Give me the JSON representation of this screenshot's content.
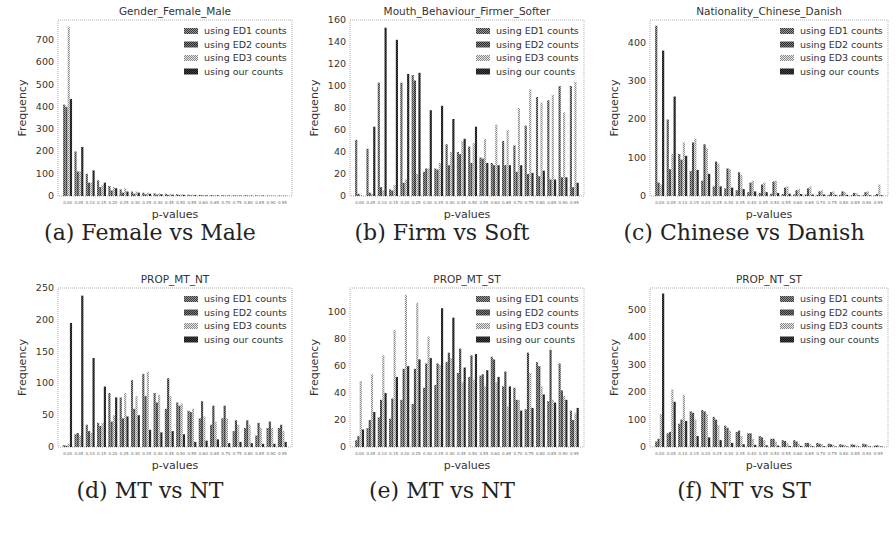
{
  "figure": {
    "captions": [
      "(a) Female vs Male",
      "(b) Firm vs Soft",
      "(c) Chinese vs Danish",
      "(d) MT vs NT",
      "(e) MT vs NT",
      "(f) NT vs ST"
    ]
  },
  "legend": {
    "entries": [
      "using ED1 counts",
      "using ED2 counts",
      "using ED3 counts",
      "using our counts"
    ],
    "colors": [
      "#555555",
      "#6a6a6a",
      "#b5b5b5",
      "#2a2a2a"
    ]
  },
  "chart_data": [
    {
      "type": "bar",
      "title": "Gender_Female_Male",
      "xlabel": "p-values",
      "ylabel": "Frequency",
      "ylim": [
        0,
        790
      ],
      "yticks": [
        0,
        100,
        200,
        300,
        400,
        500,
        600,
        700
      ],
      "categories": [
        "0.00",
        "0.05",
        "0.10",
        "0.15",
        "0.20",
        "0.25",
        "0.30",
        "0.35",
        "0.40",
        "0.45",
        "0.50",
        "0.55",
        "0.60",
        "0.65",
        "0.70",
        "0.75",
        "0.80",
        "0.85",
        "0.90",
        "0.95"
      ],
      "series": [
        {
          "name": "using ED1 counts",
          "values": [
            410,
            200,
            100,
            70,
            45,
            30,
            20,
            15,
            12,
            10,
            8,
            6,
            5,
            4,
            4,
            3,
            3,
            3,
            2,
            2
          ]
        },
        {
          "name": "using ED2 counts",
          "values": [
            400,
            110,
            60,
            40,
            25,
            15,
            10,
            8,
            6,
            5,
            4,
            3,
            3,
            2,
            2,
            2,
            2,
            1,
            1,
            1
          ]
        },
        {
          "name": "using ED3 counts",
          "values": [
            760,
            110,
            60,
            50,
            40,
            35,
            20,
            15,
            12,
            10,
            8,
            6,
            5,
            4,
            4,
            3,
            3,
            3,
            3,
            3
          ]
        },
        {
          "name": "using our counts",
          "values": [
            435,
            220,
            115,
            60,
            35,
            20,
            15,
            10,
            8,
            6,
            5,
            4,
            3,
            3,
            2,
            2,
            2,
            2,
            1,
            1
          ]
        }
      ],
      "legend_position": "upper right",
      "grid": false
    },
    {
      "type": "bar",
      "title": "Mouth_Behaviour_Firmer_Softer",
      "xlabel": "p-values",
      "ylabel": "Frequency",
      "ylim": [
        0,
        160
      ],
      "yticks": [
        0,
        20,
        40,
        60,
        80,
        100,
        120,
        140,
        160
      ],
      "categories": [
        "0.00",
        "0.05",
        "0.10",
        "0.15",
        "0.20",
        "0.25",
        "0.30",
        "0.35",
        "0.40",
        "0.45",
        "0.50",
        "0.55",
        "0.60",
        "0.65",
        "0.70",
        "0.75",
        "0.80",
        "0.85",
        "0.90",
        "0.95"
      ],
      "series": [
        {
          "name": "using ED1 counts",
          "values": [
            51,
            43,
            103,
            6,
            103,
            110,
            22,
            25,
            47,
            40,
            45,
            35,
            30,
            50,
            46,
            64,
            90,
            87,
            100,
            100
          ]
        },
        {
          "name": "using ED2 counts",
          "values": [
            2,
            3,
            8,
            5,
            12,
            105,
            25,
            24,
            28,
            38,
            30,
            34,
            28,
            28,
            22,
            20,
            18,
            15,
            17,
            8
          ]
        },
        {
          "name": "using ED3 counts",
          "values": [
            1,
            2,
            5,
            10,
            15,
            20,
            25,
            30,
            40,
            50,
            48,
            52,
            65,
            60,
            80,
            97,
            85,
            92,
            76,
            118
          ]
        },
        {
          "name": "using our counts",
          "values": [
            0,
            63,
            153,
            142,
            111,
            112,
            78,
            82,
            70,
            52,
            63,
            30,
            28,
            28,
            28,
            21,
            23,
            15,
            17,
            12
          ]
        }
      ],
      "legend_position": "upper right",
      "grid": false
    },
    {
      "type": "bar",
      "title": "Nationality_Chinese_Danish",
      "xlabel": "p-values",
      "ylabel": "Frequency",
      "ylim": [
        0,
        460
      ],
      "yticks": [
        0,
        100,
        200,
        300,
        400
      ],
      "categories": [
        "0.00",
        "0.05",
        "0.10",
        "0.15",
        "0.20",
        "0.25",
        "0.30",
        "0.35",
        "0.40",
        "0.45",
        "0.50",
        "0.55",
        "0.60",
        "0.65",
        "0.70",
        "0.75",
        "0.80",
        "0.85",
        "0.90",
        "0.95"
      ],
      "series": [
        {
          "name": "using ED1 counts",
          "values": [
            445,
            200,
            110,
            65,
            40,
            25,
            20,
            15,
            10,
            8,
            6,
            5,
            4,
            4,
            3,
            3,
            3,
            2,
            2,
            2
          ]
        },
        {
          "name": "using ED2 counts",
          "values": [
            35,
            70,
            95,
            140,
            135,
            90,
            72,
            62,
            35,
            30,
            38,
            22,
            15,
            20,
            12,
            10,
            12,
            8,
            10,
            5
          ]
        },
        {
          "name": "using ED3 counts",
          "values": [
            30,
            110,
            140,
            150,
            125,
            85,
            70,
            55,
            40,
            35,
            40,
            25,
            18,
            25,
            15,
            12,
            10,
            8,
            12,
            30
          ]
        },
        {
          "name": "using our counts",
          "values": [
            380,
            260,
            105,
            68,
            58,
            25,
            22,
            18,
            12,
            10,
            8,
            6,
            5,
            4,
            4,
            3,
            3,
            2,
            2,
            2
          ]
        }
      ],
      "legend_position": "upper right",
      "grid": false
    },
    {
      "type": "bar",
      "title": "PROP_MT_NT",
      "xlabel": "p-values",
      "ylabel": "Frequency",
      "ylim": [
        0,
        250
      ],
      "yticks": [
        0,
        50,
        100,
        150,
        200,
        250
      ],
      "categories": [
        "0.00",
        "0.05",
        "0.10",
        "0.15",
        "0.20",
        "0.25",
        "0.30",
        "0.35",
        "0.40",
        "0.45",
        "0.50",
        "0.55",
        "0.60",
        "0.65",
        "0.70",
        "0.75",
        "0.80",
        "0.85",
        "0.90",
        "0.95"
      ],
      "series": [
        {
          "name": "using ED1 counts",
          "values": [
            3,
            20,
            35,
            38,
            85,
            78,
            105,
            115,
            85,
            60,
            70,
            57,
            45,
            35,
            45,
            25,
            30,
            18,
            30,
            30
          ]
        },
        {
          "name": "using ED2 counts",
          "values": [
            2,
            22,
            25,
            33,
            40,
            45,
            60,
            80,
            70,
            108,
            65,
            55,
            72,
            65,
            65,
            42,
            42,
            38,
            40,
            35
          ]
        },
        {
          "name": "using ED3 counts",
          "values": [
            5,
            18,
            22,
            38,
            50,
            85,
            80,
            118,
            82,
            80,
            68,
            60,
            48,
            40,
            45,
            35,
            35,
            30,
            30,
            25
          ]
        },
        {
          "name": "using our counts",
          "values": [
            195,
            238,
            140,
            95,
            78,
            48,
            50,
            27,
            23,
            25,
            20,
            8,
            10,
            12,
            6,
            8,
            6,
            5,
            5,
            8
          ]
        }
      ],
      "legend_position": "upper right",
      "grid": false
    },
    {
      "type": "bar",
      "title": "PROP_MT_ST",
      "xlabel": "p-values",
      "ylabel": "Frequency",
      "ylim": [
        0,
        118
      ],
      "yticks": [
        0,
        20,
        40,
        60,
        80,
        100
      ],
      "categories": [
        "0.00",
        "0.05",
        "0.10",
        "0.15",
        "0.20",
        "0.25",
        "0.30",
        "0.35",
        "0.40",
        "0.45",
        "0.50",
        "0.55",
        "0.60",
        "0.65",
        "0.70",
        "0.75",
        "0.80",
        "0.85",
        "0.90",
        "0.95"
      ],
      "series": [
        {
          "name": "using ED1 counts",
          "values": [
            5,
            14,
            22,
            21,
            35,
            32,
            44,
            46,
            63,
            55,
            52,
            53,
            67,
            45,
            44,
            28,
            63,
            34,
            62,
            27
          ]
        },
        {
          "name": "using ED2 counts",
          "values": [
            8,
            20,
            35,
            36,
            58,
            58,
            62,
            62,
            70,
            73,
            68,
            54,
            65,
            56,
            35,
            70,
            60,
            75,
            42,
            20
          ]
        },
        {
          "name": "using ED3 counts",
          "values": [
            49,
            54,
            68,
            87,
            113,
            107,
            82,
            61,
            66,
            48,
            50,
            45,
            48,
            30,
            35,
            55,
            45,
            35,
            38,
            25
          ]
        },
        {
          "name": "using our counts",
          "values": [
            13,
            26,
            40,
            52,
            60,
            65,
            66,
            103,
            96,
            59,
            69,
            57,
            52,
            45,
            27,
            29,
            39,
            33,
            35,
            29
          ]
        }
      ],
      "legend_position": "upper right",
      "grid": false
    },
    {
      "type": "bar",
      "title": "PROP_NT_ST",
      "xlabel": "p-values",
      "ylabel": "Frequency",
      "ylim": [
        0,
        580
      ],
      "yticks": [
        0,
        100,
        200,
        300,
        400,
        500
      ],
      "categories": [
        "0.00",
        "0.05",
        "0.10",
        "0.15",
        "0.20",
        "0.25",
        "0.30",
        "0.35",
        "0.40",
        "0.45",
        "0.50",
        "0.55",
        "0.60",
        "0.65",
        "0.70",
        "0.75",
        "0.80",
        "0.85",
        "0.90",
        "0.95"
      ],
      "series": [
        {
          "name": "using ED1 counts",
          "values": [
            20,
            50,
            85,
            130,
            135,
            110,
            78,
            55,
            50,
            40,
            30,
            25,
            25,
            15,
            15,
            12,
            10,
            10,
            12,
            5
          ]
        },
        {
          "name": "using ED2 counts",
          "values": [
            30,
            55,
            100,
            125,
            130,
            100,
            70,
            60,
            50,
            35,
            30,
            22,
            20,
            15,
            12,
            10,
            8,
            8,
            10,
            6
          ]
        },
        {
          "name": "using ED3 counts",
          "values": [
            120,
            210,
            190,
            100,
            120,
            80,
            60,
            40,
            30,
            25,
            20,
            15,
            12,
            10,
            10,
            8,
            8,
            6,
            6,
            5
          ]
        },
        {
          "name": "using our counts",
          "values": [
            560,
            165,
            95,
            40,
            35,
            25,
            15,
            10,
            8,
            6,
            5,
            4,
            4,
            3,
            3,
            2,
            2,
            2,
            2,
            2
          ]
        }
      ],
      "legend_position": "upper right",
      "grid": false
    }
  ]
}
